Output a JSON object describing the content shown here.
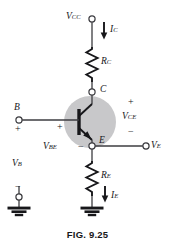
{
  "figure": {
    "caption": "FIG. 9.25",
    "type": "schematic-circuit-diagram"
  },
  "labels": {
    "supply": {
      "base": "V",
      "sub": "CC"
    },
    "collector_current": {
      "base": "I",
      "sub": "C"
    },
    "collector_resistor": {
      "base": "R",
      "sub": "C"
    },
    "collector_node": "C",
    "base_node": "B",
    "emitter_node": "E",
    "collector_emitter_voltage": {
      "base": "V",
      "sub": "CE"
    },
    "base_emitter_voltage": {
      "base": "V",
      "sub": "BE"
    },
    "base_voltage": {
      "base": "V",
      "sub": "B"
    },
    "emitter_voltage": {
      "base": "V",
      "sub": "E"
    },
    "emitter_resistor": {
      "base": "R",
      "sub": "E"
    },
    "emitter_current": {
      "base": "I",
      "sub": "E"
    }
  },
  "polarity": {
    "base_terminal_plus": "+",
    "base_line_plus": "+",
    "base_emitter_minus": "−",
    "collector_emitter_plus": "+",
    "collector_emitter_minus": "−",
    "base_source_minus": "−"
  },
  "colors": {
    "wire": "#3c3c40",
    "ink": "#17171a",
    "transistor_shading": "#c8c8ca",
    "device": "#17171a",
    "background": "#ffffff"
  },
  "nodes": {
    "vcc_terminal": {
      "x": 92,
      "y": 19
    },
    "collector_terminal": {
      "x": 92,
      "y": 92
    },
    "emitter_terminal": {
      "x": 92,
      "y": 146
    },
    "base_terminal": {
      "x": 19,
      "y": 120
    },
    "ve_terminal": {
      "x": 146,
      "y": 146
    },
    "vb_source_terminal": {
      "x": 19,
      "y": 197
    }
  }
}
